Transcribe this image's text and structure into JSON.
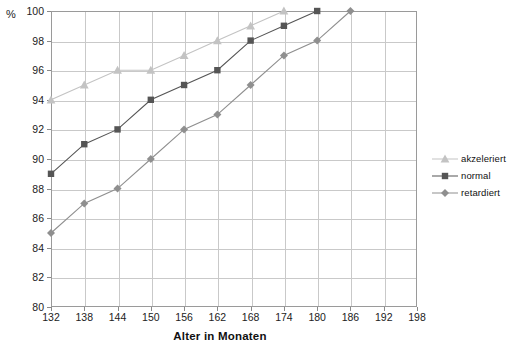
{
  "chart_data": {
    "type": "line",
    "title": "",
    "xlabel": "Alter in Monaten",
    "ylabel": "%",
    "xlim": [
      132,
      198
    ],
    "ylim": [
      80,
      100
    ],
    "xticks": [
      132,
      138,
      144,
      150,
      156,
      162,
      168,
      174,
      180,
      186,
      192,
      198
    ],
    "yticks": [
      80,
      82,
      84,
      86,
      88,
      90,
      92,
      94,
      96,
      98,
      100
    ],
    "grid": true,
    "legend_position": "right",
    "series": [
      {
        "name": "akzeleriert",
        "color": "#c3c3c3",
        "marker": "triangle",
        "x": [
          132,
          138,
          144,
          150,
          156,
          162,
          168,
          174
        ],
        "values": [
          94,
          95,
          96,
          96,
          97,
          98,
          99,
          100
        ]
      },
      {
        "name": "normal",
        "color": "#555555",
        "marker": "square",
        "x": [
          132,
          138,
          144,
          150,
          156,
          162,
          168,
          174,
          180
        ],
        "values": [
          89,
          91,
          92,
          94,
          95,
          96,
          98,
          99,
          100
        ]
      },
      {
        "name": "retardiert",
        "color": "#8f8f8f",
        "marker": "diamond",
        "x": [
          132,
          138,
          144,
          150,
          156,
          162,
          168,
          174,
          180,
          186
        ],
        "values": [
          85,
          87,
          88,
          90,
          92,
          93,
          95,
          97,
          98,
          100
        ]
      }
    ]
  },
  "axes": {
    "y_unit_label": "%",
    "x_axis_title": "Alter in Monaten"
  },
  "legend": {
    "entries": [
      {
        "label": "akzeleriert"
      },
      {
        "label": "normal"
      },
      {
        "label": "retardiert"
      }
    ]
  },
  "style": {
    "grid_color": "#c9c9c9",
    "frame_color": "#9a9a9a",
    "text_color": "#1a1a1a",
    "background": "#ffffff"
  }
}
